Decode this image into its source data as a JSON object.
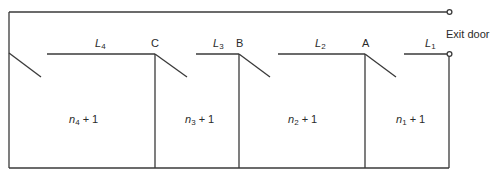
{
  "diagram": {
    "exit_label": "Exit door",
    "nodes": [
      {
        "id": "C",
        "label": "C"
      },
      {
        "id": "B",
        "label": "B"
      },
      {
        "id": "A",
        "label": "A"
      }
    ],
    "segments": [
      {
        "base": "L",
        "sub": "4"
      },
      {
        "base": "L",
        "sub": "3"
      },
      {
        "base": "L",
        "sub": "2"
      },
      {
        "base": "L",
        "sub": "1"
      }
    ],
    "rooms": [
      {
        "base": "n",
        "sub": "4",
        "suffix": " + 1"
      },
      {
        "base": "n",
        "sub": "3",
        "suffix": " + 1"
      },
      {
        "base": "n",
        "sub": "2",
        "suffix": " + 1"
      },
      {
        "base": "n",
        "sub": "1",
        "suffix": " + 1"
      }
    ],
    "line_color": "#3a3a3a"
  }
}
